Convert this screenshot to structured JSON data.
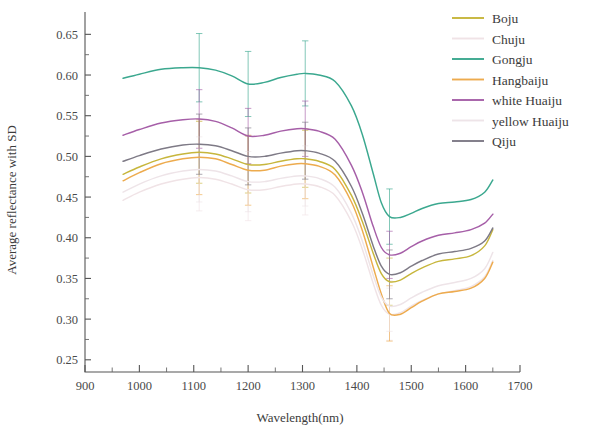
{
  "chart_data": {
    "type": "line",
    "title": "",
    "xlabel": "Wavelength(nm)",
    "ylabel": "Average reflectance with SD",
    "xlim": [
      900,
      1700
    ],
    "ylim": [
      0.235,
      0.675
    ],
    "xticks": [
      900,
      1000,
      1100,
      1200,
      1300,
      1400,
      1500,
      1600,
      1700
    ],
    "yticks": [
      0.25,
      0.3,
      0.35,
      0.4,
      0.45,
      0.5,
      0.55,
      0.6,
      0.65
    ],
    "ytick_labels": [
      "0.25",
      "0.30",
      "0.35",
      "0.40",
      "0.45",
      "0.50",
      "0.55",
      "0.60",
      "0.65"
    ],
    "xtick_labels": [
      "900",
      "1000",
      "1100",
      "1200",
      "1300",
      "1400",
      "1500",
      "1600",
      "1700"
    ],
    "minor_ticks": true,
    "grid": false,
    "legend_position": "top-right",
    "errorbar_wavelengths": [
      1110,
      1200,
      1305,
      1460
    ],
    "x": [
      970,
      1000,
      1040,
      1080,
      1110,
      1140,
      1170,
      1200,
      1230,
      1260,
      1290,
      1305,
      1330,
      1360,
      1390,
      1410,
      1430,
      1445,
      1460,
      1480,
      1500,
      1520,
      1550,
      1580,
      1610,
      1635,
      1650
    ],
    "series": [
      {
        "name": "Boju",
        "color": "#c7b63c",
        "values": [
          0.478,
          0.487,
          0.497,
          0.503,
          0.505,
          0.503,
          0.497,
          0.49,
          0.49,
          0.494,
          0.497,
          0.497,
          0.494,
          0.484,
          0.452,
          0.42,
          0.381,
          0.356,
          0.346,
          0.348,
          0.356,
          0.363,
          0.371,
          0.374,
          0.378,
          0.39,
          0.41
        ],
        "sd": [
          0.041,
          0.04,
          0.039,
          0.038,
          0.038,
          0.037,
          0.036,
          0.035,
          0.035,
          0.035,
          0.035,
          0.035,
          0.034,
          0.033,
          0.032,
          0.031,
          0.03,
          0.029,
          0.029,
          0.029,
          0.029,
          0.029,
          0.03,
          0.03,
          0.03,
          0.031,
          0.032
        ]
      },
      {
        "name": "Chuju",
        "color": "#f0e3e6",
        "values": [
          0.446,
          0.456,
          0.466,
          0.472,
          0.474,
          0.472,
          0.466,
          0.459,
          0.459,
          0.463,
          0.466,
          0.466,
          0.463,
          0.452,
          0.42,
          0.386,
          0.344,
          0.317,
          0.306,
          0.308,
          0.316,
          0.323,
          0.331,
          0.335,
          0.34,
          0.352,
          0.372
        ],
        "sd": [
          0.044,
          0.043,
          0.042,
          0.041,
          0.041,
          0.04,
          0.039,
          0.038,
          0.038,
          0.038,
          0.038,
          0.038,
          0.037,
          0.036,
          0.035,
          0.034,
          0.033,
          0.032,
          0.032,
          0.032,
          0.032,
          0.032,
          0.033,
          0.033,
          0.033,
          0.034,
          0.035
        ]
      },
      {
        "name": "Gongju",
        "color": "#3ba88f",
        "values": [
          0.596,
          0.601,
          0.607,
          0.609,
          0.609,
          0.606,
          0.599,
          0.589,
          0.591,
          0.597,
          0.601,
          0.602,
          0.6,
          0.592,
          0.562,
          0.527,
          0.479,
          0.443,
          0.426,
          0.425,
          0.43,
          0.436,
          0.442,
          0.444,
          0.447,
          0.456,
          0.471
        ],
        "sd": [
          0.044,
          0.043,
          0.042,
          0.042,
          0.042,
          0.041,
          0.04,
          0.04,
          0.04,
          0.04,
          0.04,
          0.04,
          0.039,
          0.038,
          0.037,
          0.036,
          0.035,
          0.034,
          0.034,
          0.034,
          0.034,
          0.034,
          0.034,
          0.034,
          0.035,
          0.035,
          0.036
        ]
      },
      {
        "name": "Hangbaiju",
        "color": "#edab4e",
        "values": [
          0.47,
          0.48,
          0.491,
          0.497,
          0.499,
          0.497,
          0.49,
          0.483,
          0.483,
          0.488,
          0.491,
          0.491,
          0.488,
          0.477,
          0.444,
          0.409,
          0.364,
          0.331,
          0.307,
          0.306,
          0.314,
          0.322,
          0.331,
          0.334,
          0.338,
          0.35,
          0.37
        ],
        "sd": [
          0.049,
          0.048,
          0.047,
          0.046,
          0.046,
          0.045,
          0.044,
          0.043,
          0.043,
          0.043,
          0.043,
          0.043,
          0.042,
          0.041,
          0.039,
          0.038,
          0.036,
          0.035,
          0.034,
          0.034,
          0.034,
          0.034,
          0.035,
          0.035,
          0.035,
          0.036,
          0.037
        ]
      },
      {
        "name": "white Huaiju",
        "color": "#a65fa8",
        "values": [
          0.526,
          0.533,
          0.541,
          0.545,
          0.546,
          0.543,
          0.535,
          0.525,
          0.526,
          0.531,
          0.534,
          0.534,
          0.531,
          0.521,
          0.489,
          0.456,
          0.414,
          0.388,
          0.379,
          0.381,
          0.389,
          0.396,
          0.403,
          0.406,
          0.41,
          0.418,
          0.429
        ],
        "sd": [
          0.038,
          0.037,
          0.036,
          0.036,
          0.036,
          0.035,
          0.035,
          0.034,
          0.034,
          0.034,
          0.034,
          0.034,
          0.033,
          0.033,
          0.032,
          0.031,
          0.03,
          0.029,
          0.029,
          0.029,
          0.029,
          0.029,
          0.029,
          0.029,
          0.03,
          0.03,
          0.031
        ]
      },
      {
        "name": "yellow Huaiju",
        "color": "#eee4e8",
        "values": [
          0.456,
          0.466,
          0.476,
          0.482,
          0.484,
          0.482,
          0.476,
          0.469,
          0.469,
          0.473,
          0.476,
          0.476,
          0.473,
          0.462,
          0.43,
          0.396,
          0.354,
          0.327,
          0.316,
          0.318,
          0.326,
          0.333,
          0.341,
          0.345,
          0.35,
          0.362,
          0.382
        ],
        "sd": [
          0.043,
          0.042,
          0.041,
          0.04,
          0.04,
          0.039,
          0.038,
          0.037,
          0.037,
          0.037,
          0.037,
          0.037,
          0.036,
          0.035,
          0.034,
          0.033,
          0.032,
          0.031,
          0.031,
          0.031,
          0.031,
          0.031,
          0.032,
          0.032,
          0.032,
          0.033,
          0.034
        ]
      },
      {
        "name": "Qiju",
        "color": "#7e7a86",
        "values": [
          0.494,
          0.501,
          0.509,
          0.514,
          0.515,
          0.513,
          0.507,
          0.5,
          0.5,
          0.504,
          0.507,
          0.507,
          0.504,
          0.494,
          0.463,
          0.43,
          0.39,
          0.365,
          0.355,
          0.357,
          0.365,
          0.372,
          0.38,
          0.383,
          0.387,
          0.396,
          0.412
        ],
        "sd": [
          0.039,
          0.038,
          0.037,
          0.037,
          0.037,
          0.036,
          0.036,
          0.035,
          0.035,
          0.035,
          0.035,
          0.035,
          0.034,
          0.034,
          0.033,
          0.032,
          0.031,
          0.03,
          0.03,
          0.03,
          0.03,
          0.03,
          0.031,
          0.031,
          0.031,
          0.032,
          0.033
        ]
      }
    ]
  },
  "legend": {
    "items": [
      {
        "label": "Boju"
      },
      {
        "label": "Chuju"
      },
      {
        "label": "Gongju"
      },
      {
        "label": "Hangbaiju"
      },
      {
        "label": "white Huaiju"
      },
      {
        "label": "yellow Huaiju"
      },
      {
        "label": "Qiju"
      }
    ]
  }
}
